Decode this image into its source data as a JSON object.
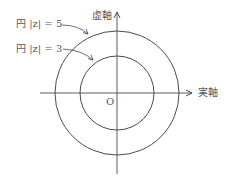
{
  "diagram": {
    "type": "complex-plane-circles",
    "axes": {
      "real_label": "実軸",
      "imag_label": "虚軸",
      "origin_label": "O"
    },
    "circles": [
      {
        "label": "円 |z| = 5",
        "radius": 5
      },
      {
        "label": "円 |z| = 3",
        "radius": 3
      }
    ],
    "colors": {
      "line": "#4a4a4a",
      "background": "#ffffff"
    }
  }
}
